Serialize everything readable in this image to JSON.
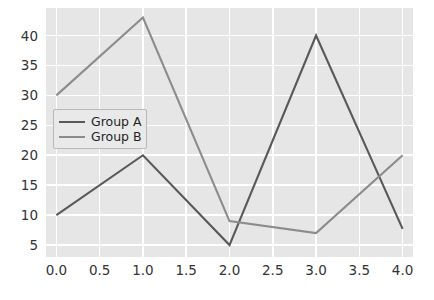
{
  "chart_data": {
    "type": "line",
    "title": "",
    "xlabel": "",
    "ylabel": "",
    "x": [
      0,
      1,
      2,
      3,
      4
    ],
    "xlim": [
      -0.12,
      4.12
    ],
    "ylim": [
      3.0,
      44.6
    ],
    "xticks": [
      "0.0",
      "0.5",
      "1.0",
      "1.5",
      "2.0",
      "2.5",
      "3.0",
      "3.5",
      "4.0"
    ],
    "xtick_values": [
      0.0,
      0.5,
      1.0,
      1.5,
      2.0,
      2.5,
      3.0,
      3.5,
      4.0
    ],
    "yticks": [
      "5",
      "10",
      "15",
      "20",
      "25",
      "30",
      "35",
      "40"
    ],
    "ytick_values": [
      5,
      10,
      15,
      20,
      25,
      30,
      35,
      40
    ],
    "grid": true,
    "legend_position": "upper left",
    "series": [
      {
        "name": "Group A",
        "values": [
          10,
          20,
          5,
          40,
          7.7
        ],
        "color": "#595959"
      },
      {
        "name": "Group B",
        "values": [
          30,
          43,
          9,
          7,
          20
        ],
        "color": "#8c8c8c"
      }
    ],
    "style": {
      "axes_facecolor": "#e6e6e6",
      "figure_facecolor": "#ffffff",
      "gridcolor": "#ffffff",
      "tick_color": "#333333",
      "legend_facecolor": "#e9e9e9",
      "legend_edgecolor": "#b9b9b9"
    }
  }
}
